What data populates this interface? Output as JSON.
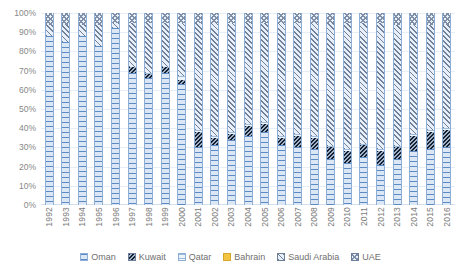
{
  "chart_data": {
    "type": "bar",
    "subtype": "100% stacked column",
    "title": "",
    "xlabel": "",
    "ylabel": "",
    "ylim": [
      0,
      100
    ],
    "ytick_labels": [
      "100%",
      "90%",
      "80%",
      "70%",
      "60%",
      "50%",
      "40%",
      "30%",
      "20%",
      "10%",
      "0%"
    ],
    "ytick_values": [
      100,
      90,
      80,
      70,
      60,
      50,
      40,
      30,
      20,
      10,
      0
    ],
    "grid": true,
    "legend_position": "bottom",
    "categories": [
      "1992",
      "1993",
      "1994",
      "1995",
      "1996",
      "1997",
      "1998",
      "1999",
      "2000",
      "2001",
      "2002",
      "2003",
      "2004",
      "2005",
      "2006",
      "2007",
      "2008",
      "2009",
      "2010",
      "2011",
      "2012",
      "2013",
      "2014",
      "2015",
      "2016"
    ],
    "series": [
      {
        "name": "Oman",
        "pattern": "horizontal-lines",
        "color": "#dce7f5",
        "values": [
          88,
          85,
          88,
          83,
          92,
          69,
          66,
          69,
          63,
          30,
          31,
          34,
          36,
          38,
          31,
          30,
          29,
          24,
          22,
          25,
          21,
          24,
          28,
          29,
          30
        ]
      },
      {
        "name": "Kuwait",
        "pattern": "dense-diagonal-dark",
        "color": "#3a4a63",
        "values": [
          0,
          0,
          0,
          0,
          0,
          3,
          2,
          3,
          2,
          8,
          4,
          3,
          5,
          4,
          4,
          6,
          6,
          6,
          6,
          6,
          7,
          6,
          8,
          9,
          9
        ]
      },
      {
        "name": "Qatar",
        "pattern": "fine-horizontal-lines",
        "color": "#eef4fb",
        "values": [
          0,
          0,
          0,
          0,
          0,
          0,
          1,
          0,
          2,
          1,
          1,
          1,
          1,
          1,
          1,
          1,
          1,
          1,
          1,
          1,
          1,
          1,
          1,
          1,
          1
        ]
      },
      {
        "name": "Bahrain",
        "pattern": "solid",
        "color": "#f5c342",
        "values": [
          0,
          0,
          0,
          0,
          0,
          0,
          0,
          0,
          0,
          0,
          0,
          0,
          0,
          0,
          0,
          0,
          0,
          0,
          0,
          0,
          0,
          0,
          0,
          0,
          0
        ]
      },
      {
        "name": "Saudi Arabia",
        "pattern": "diagonal-hatch",
        "color": "#e8eff8",
        "values": [
          6,
          9,
          6,
          11,
          3,
          23,
          26,
          23,
          28,
          56,
          59,
          57,
          53,
          52,
          59,
          58,
          59,
          64,
          66,
          63,
          66,
          63,
          57,
          55,
          54
        ]
      },
      {
        "name": "UAE",
        "pattern": "cross-hatch",
        "color": "#eaf1f9",
        "values": [
          6,
          6,
          6,
          6,
          5,
          5,
          5,
          5,
          5,
          5,
          5,
          5,
          5,
          5,
          5,
          5,
          5,
          5,
          5,
          5,
          5,
          6,
          6,
          6,
          6
        ]
      }
    ]
  },
  "legend": {
    "items": [
      {
        "label": "Oman",
        "key": "oman"
      },
      {
        "label": "Kuwait",
        "key": "kuwait"
      },
      {
        "label": "Qatar",
        "key": "qatar"
      },
      {
        "label": "Bahrain",
        "key": "bahrain"
      },
      {
        "label": "Saudi Arabia",
        "key": "saudi"
      },
      {
        "label": "UAE",
        "key": "uae"
      }
    ]
  }
}
